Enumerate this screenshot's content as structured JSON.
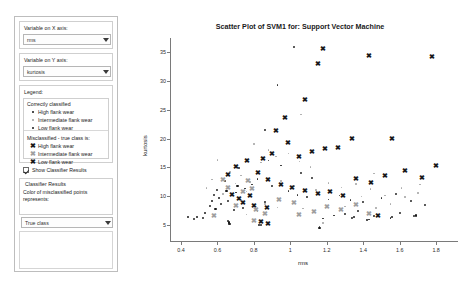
{
  "sidebar": {
    "x_axis_group_label": "Variable on X axis:",
    "x_axis_value": "rms",
    "y_axis_group_label": "Variable on Y axis:",
    "y_axis_value": "kurtosis",
    "legend_group_label": "Legend:",
    "legend": {
      "correct_header": "Correctly classified",
      "correct_items": [
        {
          "marker": "dot-sm",
          "label": "High flank wear"
        },
        {
          "marker": "dot-md",
          "label": "Intermediate flank wear"
        },
        {
          "marker": "dot-lg",
          "label": "Low flank wear"
        }
      ],
      "mis_header": "Misclassified - true class is:",
      "mis_items": [
        {
          "marker": "x-dark",
          "label": "High flank wear"
        },
        {
          "marker": "x-gray",
          "label": "Intermediate flank wear"
        },
        {
          "marker": "x-dark",
          "label": "Low flank wear"
        }
      ]
    },
    "show_classifier_results_label": "Show Classifier Results",
    "show_classifier_results_checked": true,
    "classifier_results_group_label": "Classifier Results",
    "color_note_line1": "Color of misclassified points",
    "color_note_line2": "represents:",
    "color_select_value": "True class"
  },
  "chart_data": {
    "type": "scatter",
    "title": "Scatter Plot of SVM1 for: Support Vector Machine",
    "xlabel": "rms",
    "ylabel": "kurtosis",
    "xlim": [
      0.34,
      1.92
    ],
    "ylim": [
      2.0,
      37.5
    ],
    "xticks": [
      0.4,
      0.6,
      0.8,
      1,
      1.2,
      1.4,
      1.6,
      1.8
    ],
    "xticklabels": [
      "0.4",
      "0.6",
      "0.8",
      "1",
      "1.2",
      "1.4",
      "1.6",
      "1.8"
    ],
    "yticks": [
      5,
      10,
      15,
      20,
      25,
      30,
      35
    ],
    "yticklabels": [
      "5",
      "10",
      "15",
      "20",
      "25",
      "30",
      "35"
    ],
    "grid": false,
    "legend_position": "external-sidebar",
    "series": [
      {
        "name": "Correctly classified - High flank wear",
        "marker": "dot",
        "size": 1.8,
        "color": "#2b2b2b",
        "points": [
          [
            1.02,
            36.0
          ],
          [
            0.93,
            29.3
          ],
          [
            0.86,
            21.5
          ],
          [
            0.72,
            14.9
          ],
          [
            0.64,
            12.6
          ],
          [
            0.6,
            11.0
          ],
          [
            0.58,
            10.2
          ],
          [
            0.7,
            10.6
          ],
          [
            0.75,
            11.3
          ],
          [
            0.79,
            12.0
          ],
          [
            0.82,
            13.0
          ],
          [
            0.66,
            9.2
          ],
          [
            0.62,
            8.6
          ],
          [
            0.56,
            8.2
          ],
          [
            0.52,
            6.2
          ],
          [
            0.47,
            6.0
          ],
          [
            0.66,
            5.6
          ],
          [
            0.665,
            5.2
          ],
          [
            0.84,
            4.9
          ],
          [
            1.16,
            4.6
          ],
          [
            1.18,
            6.1
          ],
          [
            1.34,
            6.2
          ],
          [
            1.43,
            5.9
          ],
          [
            1.55,
            6.2
          ],
          [
            1.68,
            6.5
          ],
          [
            1.37,
            7.4
          ],
          [
            1.3,
            6.9
          ],
          [
            1.24,
            6.6
          ],
          [
            1.46,
            6.5
          ],
          [
            1.6,
            7.1
          ],
          [
            0.88,
            16.2
          ],
          [
            0.95,
            15.3
          ],
          [
            1.06,
            14.0
          ],
          [
            1.12,
            13.2
          ],
          [
            0.9,
            11.8
          ],
          [
            0.99,
            10.9
          ],
          [
            1.04,
            10.2
          ],
          [
            1.09,
            9.8
          ],
          [
            0.86,
            9.0
          ],
          [
            0.8,
            8.4
          ],
          [
            0.74,
            7.9
          ],
          [
            0.69,
            7.5
          ],
          [
            1.21,
            9.4
          ],
          [
            1.27,
            10.1
          ],
          [
            1.33,
            9.3
          ],
          [
            1.4,
            8.9
          ],
          [
            1.5,
            9.6
          ],
          [
            1.58,
            10.3
          ],
          [
            1.66,
            9.1
          ],
          [
            1.74,
            8.5
          ]
        ]
      },
      {
        "name": "Correctly classified - Intermediate flank wear",
        "marker": "dot",
        "size": 1.6,
        "color": "#a8a8a8",
        "points": [
          [
            1.06,
            24.2
          ],
          [
            0.8,
            19.1
          ],
          [
            0.6,
            16.3
          ],
          [
            0.67,
            14.2
          ],
          [
            0.73,
            13.6
          ],
          [
            0.78,
            12.4
          ],
          [
            0.84,
            15.8
          ],
          [
            0.92,
            16.9
          ],
          [
            0.99,
            17.4
          ],
          [
            1.05,
            16.0
          ],
          [
            1.11,
            15.1
          ],
          [
            0.57,
            12.9
          ],
          [
            0.54,
            11.4
          ],
          [
            0.63,
            10.4
          ],
          [
            0.7,
            12.2
          ],
          [
            0.76,
            10.8
          ],
          [
            0.88,
            18.0
          ],
          [
            0.95,
            12.6
          ],
          [
            1.02,
            11.7
          ],
          [
            1.14,
            11.0
          ],
          [
            1.21,
            12.3
          ],
          [
            1.28,
            11.5
          ],
          [
            1.36,
            12.1
          ],
          [
            1.44,
            11.2
          ],
          [
            1.52,
            10.1
          ],
          [
            1.61,
            11.4
          ],
          [
            1.7,
            10.5
          ],
          [
            1.46,
            13.9
          ],
          [
            1.39,
            9.9
          ],
          [
            0.86,
            8.6
          ],
          [
            0.93,
            8.0
          ],
          [
            1.07,
            7.8
          ],
          [
            1.3,
            8.2
          ],
          [
            1.47,
            7.9
          ],
          [
            1.55,
            8.6
          ],
          [
            0.82,
            7.4
          ],
          [
            0.76,
            6.8
          ],
          [
            1.18,
            5.3
          ],
          [
            1.63,
            9.8
          ],
          [
            1.71,
            12.0
          ]
        ]
      },
      {
        "name": "Correctly classified - Low flank wear",
        "marker": "dot",
        "size": 2.2,
        "color": "#1a1a1a",
        "points": [
          [
            0.44,
            6.3
          ],
          [
            0.49,
            6.4
          ],
          [
            0.53,
            7.1
          ],
          [
            0.59,
            7.8
          ],
          [
            0.665,
            5.4
          ],
          [
            0.67,
            5.1
          ],
          [
            0.83,
            5.0
          ],
          [
            1.16,
            4.4
          ],
          [
            1.35,
            6.3
          ],
          [
            1.42,
            5.8
          ],
          [
            1.56,
            6.3
          ],
          [
            1.69,
            6.6
          ],
          [
            0.61,
            9.6
          ],
          [
            0.57,
            9.1
          ],
          [
            0.65,
            10.9
          ],
          [
            0.71,
            11.7
          ]
        ]
      },
      {
        "name": "Misclassified - High flank wear",
        "marker": "x",
        "size": 6.5,
        "color": "#1a1a1a",
        "points": [
          [
            1.18,
            35.6
          ],
          [
            1.15,
            33.0
          ],
          [
            1.43,
            34.3
          ],
          [
            1.78,
            34.2
          ],
          [
            1.08,
            26.6
          ],
          [
            0.97,
            23.5
          ],
          [
            0.92,
            21.2
          ],
          [
            1.56,
            19.8
          ],
          [
            1.34,
            19.9
          ],
          [
            1.26,
            18.3
          ],
          [
            1.19,
            18.1
          ],
          [
            1.12,
            17.6
          ],
          [
            1.05,
            16.8
          ],
          [
            0.99,
            19.2
          ],
          [
            0.9,
            17.3
          ],
          [
            0.85,
            16.4
          ],
          [
            1.8,
            15.2
          ],
          [
            1.72,
            13.1
          ],
          [
            1.63,
            14.3
          ],
          [
            1.52,
            13.4
          ],
          [
            1.44,
            12.2
          ],
          [
            1.36,
            13.0
          ],
          [
            0.82,
            14.0
          ],
          [
            0.88,
            12.8
          ],
          [
            0.95,
            11.9
          ],
          [
            1.01,
            11.4
          ],
          [
            1.08,
            10.9
          ],
          [
            1.15,
            10.3
          ],
          [
            1.22,
            10.7
          ],
          [
            1.29,
            10.0
          ],
          [
            0.78,
            9.9
          ],
          [
            0.72,
            9.4
          ],
          [
            0.68,
            10.2
          ],
          [
            0.74,
            8.8
          ],
          [
            0.8,
            8.3
          ],
          [
            0.87,
            7.9
          ],
          [
            1.48,
            6.4
          ],
          [
            0.88,
            5.1
          ],
          [
            0.84,
            5.5
          ],
          [
            0.66,
            13.7
          ],
          [
            0.7,
            15.0
          ],
          [
            0.76,
            16.1
          ]
        ]
      },
      {
        "name": "Misclassified - Intermediate flank wear",
        "marker": "x",
        "size": 6.5,
        "color": "#a0a0a0",
        "points": [
          [
            0.77,
            12.5
          ],
          [
            0.79,
            11.2
          ],
          [
            0.74,
            10.6
          ],
          [
            0.7,
            8.2
          ],
          [
            0.81,
            7.6
          ],
          [
            0.86,
            6.9
          ],
          [
            0.8,
            5.6
          ],
          [
            1.2,
            8.0
          ],
          [
            1.28,
            7.5
          ],
          [
            1.36,
            8.4
          ],
          [
            1.13,
            7.2
          ],
          [
            0.94,
            9.2
          ],
          [
            1.02,
            8.7
          ],
          [
            0.66,
            11.4
          ],
          [
            0.63,
            12.8
          ],
          [
            1.43,
            6.9
          ],
          [
            1.05,
            6.6
          ],
          [
            0.58,
            6.5
          ]
        ]
      }
    ]
  }
}
